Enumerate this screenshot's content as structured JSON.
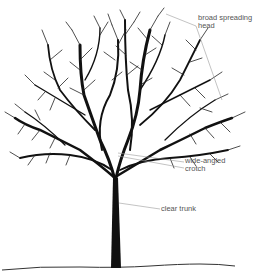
{
  "diagram": {
    "labels": [
      {
        "id": "head",
        "text": "broad spreading\nhead"
      },
      {
        "id": "crotch",
        "text": "wide-angled\ncrotch"
      },
      {
        "id": "trunk",
        "text": "clear trunk"
      }
    ],
    "colors": {
      "background": "#ffffff",
      "tree": "#111111",
      "leader_line": "#9a9a9a",
      "label_text": "#555555"
    }
  }
}
